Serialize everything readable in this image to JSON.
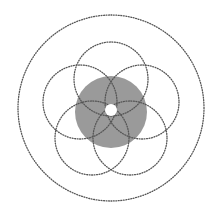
{
  "diagram": {
    "width": 224,
    "height": 215,
    "background": "#ffffff",
    "stroke_color": "#555555",
    "stroke_width": 1.3,
    "dash_pattern": "0.9 1.6",
    "outer_circle": {
      "cx": 111,
      "cy": 108,
      "r": 93
    },
    "center_disk": {
      "cx": 111,
      "cy": 112,
      "r": 36,
      "fill": "#9a9a9a"
    },
    "center_hole": {
      "cx": 111,
      "cy": 110,
      "r": 6,
      "fill": "#ffffff"
    },
    "petal_circles": [
      {
        "name": "top",
        "cx": 111,
        "cy": 79,
        "r": 37
      },
      {
        "name": "upper-left",
        "cx": 80,
        "cy": 102,
        "r": 37
      },
      {
        "name": "upper-right",
        "cx": 142,
        "cy": 102,
        "r": 37
      },
      {
        "name": "lower-left",
        "cx": 92,
        "cy": 138,
        "r": 37
      },
      {
        "name": "lower-right",
        "cx": 130,
        "cy": 138,
        "r": 37
      }
    ]
  }
}
